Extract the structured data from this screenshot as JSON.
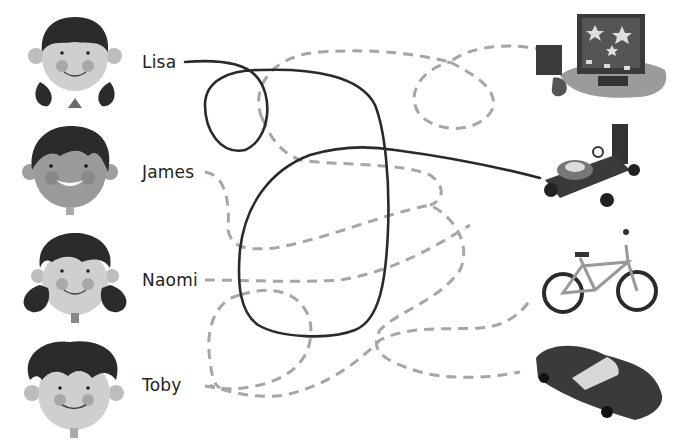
{
  "exercise": {
    "type": "follow-the-lines maze",
    "children": [
      {
        "id": "lisa",
        "name": "Lisa",
        "hair": "black bangs with pigtails"
      },
      {
        "id": "james",
        "name": "James",
        "hair": "spiky dark hair"
      },
      {
        "id": "naomi",
        "name": "Naomi",
        "hair": "curly pigtails"
      },
      {
        "id": "toby",
        "name": "Toby",
        "hair": "curly hair"
      }
    ],
    "items": [
      {
        "id": "computer",
        "label": "computer with games console"
      },
      {
        "id": "robot-kit",
        "label": "model buggy kit"
      },
      {
        "id": "bicycle",
        "label": "bicycle"
      },
      {
        "id": "car",
        "label": "toy car"
      }
    ],
    "example_answer": {
      "from": "Lisa",
      "to": "robot-kit",
      "line_style": "solid"
    },
    "colors": {
      "solid_line": "#2a2a2a",
      "dashed_line": "#a6a6a6",
      "skin": "#c9c9c9",
      "hair": "#2b2b2b",
      "cheek": "#a0a0a0",
      "background": "#ffffff"
    }
  }
}
